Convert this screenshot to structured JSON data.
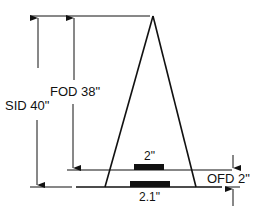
{
  "diagram": {
    "labels": {
      "sid": "SID 40\"",
      "fod": "FOD 38\"",
      "ofd": "OFD 2\"",
      "object_size": "2\"",
      "image_size": "2.1\""
    },
    "values": {
      "sid_inches": 40,
      "fod_inches": 38,
      "ofd_inches": 2,
      "object_size_inches": 2,
      "image_size_inches": 2.1
    },
    "colors": {
      "ink": "#111111",
      "background": "#ffffff"
    }
  }
}
